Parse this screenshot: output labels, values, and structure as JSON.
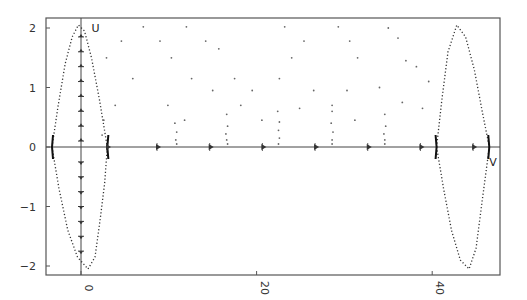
{
  "chart_data": {
    "type": "scatter",
    "title": "",
    "xlabel": "",
    "ylabel": "",
    "xlim": [
      -4,
      47
    ],
    "ylim": [
      -2.2,
      2.2
    ],
    "grid": false,
    "legend": null,
    "x_ticks": [
      {
        "value": 0,
        "label": "0",
        "rotated": true
      },
      {
        "value": 20,
        "label": "20",
        "rotated": true
      },
      {
        "value": 40,
        "label": "40",
        "rotated": true
      }
    ],
    "y_ticks": [
      {
        "value": 2,
        "label": "2"
      },
      {
        "value": 1,
        "label": "1"
      },
      {
        "value": 0,
        "label": "0"
      },
      {
        "value": -1,
        "label": "-1"
      },
      {
        "value": -2,
        "label": "-2"
      }
    ],
    "annotations": [
      {
        "text": "U",
        "x": 1.2,
        "y": 2.0
      },
      {
        "text": "V",
        "x": 46.5,
        "y": -0.25
      }
    ],
    "series": [
      {
        "name": "left-orbit-upper",
        "description": "dotted arc from (-3.3,0) to (3.0,0) peaking at (-0.3,2.05)",
        "points": [
          [
            -3.3,
            0
          ],
          [
            -2.6,
            0.7
          ],
          [
            -1.8,
            1.4
          ],
          [
            -1.0,
            1.85
          ],
          [
            -0.3,
            2.05
          ],
          [
            0.4,
            1.95
          ],
          [
            1.2,
            1.5
          ],
          [
            2.1,
            0.8
          ],
          [
            3.0,
            0
          ]
        ]
      },
      {
        "name": "left-orbit-lower",
        "description": "dotted arc from (-3.3,0) to (3.0,0) with trough at (0.8,-2.05)",
        "points": [
          [
            -3.3,
            0
          ],
          [
            -2.5,
            -0.7
          ],
          [
            -1.5,
            -1.4
          ],
          [
            -0.4,
            -1.85
          ],
          [
            0.8,
            -2.05
          ],
          [
            1.6,
            -1.85
          ],
          [
            2.2,
            -1.2
          ],
          [
            2.7,
            -0.6
          ],
          [
            3.0,
            0
          ]
        ]
      },
      {
        "name": "right-orbit-upper",
        "description": "dotted arc from (40.5,0) to (46.5,0) peaking at (42.8,2.05)",
        "points": [
          [
            40.5,
            0
          ],
          [
            41.1,
            0.8
          ],
          [
            41.8,
            1.6
          ],
          [
            42.8,
            2.05
          ],
          [
            43.8,
            1.85
          ],
          [
            44.8,
            1.3
          ],
          [
            45.7,
            0.6
          ],
          [
            46.5,
            0
          ]
        ]
      },
      {
        "name": "right-orbit-lower",
        "description": "dotted arc from (40.5,0) to (46.5,0) with trough at (44.2,-2.05)",
        "points": [
          [
            40.5,
            0
          ],
          [
            41.3,
            -0.7
          ],
          [
            42.2,
            -1.4
          ],
          [
            43.2,
            -1.9
          ],
          [
            44.2,
            -2.05
          ],
          [
            45.0,
            -1.7
          ],
          [
            45.7,
            -0.9
          ],
          [
            46.5,
            0
          ]
        ]
      },
      {
        "name": "scattered-points",
        "description": "sparse scattered iterates between the two orbits",
        "points": [
          [
            4.6,
            1.78
          ],
          [
            7.1,
            2.02
          ],
          [
            2.9,
            1.5
          ],
          [
            5.9,
            1.15
          ],
          [
            3.9,
            0.7
          ],
          [
            2.6,
            0.45
          ],
          [
            2.4,
            0.2
          ],
          [
            9.0,
            1.78
          ],
          [
            12.0,
            2.02
          ],
          [
            10.3,
            1.5
          ],
          [
            12.6,
            1.15
          ],
          [
            15.0,
            0.95
          ],
          [
            11.8,
            0.45
          ],
          [
            9.9,
            0.7
          ],
          [
            14.2,
            1.78
          ],
          [
            15.7,
            1.65
          ],
          [
            17.5,
            1.15
          ],
          [
            18.2,
            0.7
          ],
          [
            19.5,
            0.95
          ],
          [
            20.6,
            0.45
          ],
          [
            23.2,
            2.02
          ],
          [
            24.0,
            1.5
          ],
          [
            25.4,
            1.78
          ],
          [
            22.6,
            1.15
          ],
          [
            26.5,
            0.95
          ],
          [
            24.9,
            0.65
          ],
          [
            29.3,
            2.02
          ],
          [
            30.6,
            1.78
          ],
          [
            31.5,
            1.5
          ],
          [
            30.3,
            0.95
          ],
          [
            28.6,
            0.7
          ],
          [
            31.2,
            0.45
          ],
          [
            35.0,
            2.0
          ],
          [
            36.1,
            1.83
          ],
          [
            37.0,
            1.45
          ],
          [
            38.2,
            1.35
          ],
          [
            34.0,
            1.0
          ],
          [
            36.6,
            0.75
          ],
          [
            38.9,
            0.65
          ],
          [
            39.6,
            1.1
          ]
        ]
      },
      {
        "name": "cascade-clusters",
        "description": "dot clusters converging to the zero line",
        "points": [
          [
            10.7,
            0.4
          ],
          [
            10.9,
            0.25
          ],
          [
            10.8,
            0.12
          ],
          [
            10.9,
            0.05
          ],
          [
            16.6,
            0.55
          ],
          [
            16.7,
            0.35
          ],
          [
            16.5,
            0.22
          ],
          [
            16.6,
            0.12
          ],
          [
            16.7,
            0.05
          ],
          [
            22.4,
            0.6
          ],
          [
            22.6,
            0.42
          ],
          [
            22.5,
            0.28
          ],
          [
            22.6,
            0.15
          ],
          [
            22.5,
            0.05
          ],
          [
            28.6,
            0.6
          ],
          [
            28.5,
            0.4
          ],
          [
            28.7,
            0.25
          ],
          [
            28.6,
            0.12
          ],
          [
            28.6,
            0.05
          ],
          [
            34.6,
            0.55
          ],
          [
            34.7,
            0.35
          ],
          [
            34.5,
            0.22
          ],
          [
            34.6,
            0.12
          ],
          [
            34.6,
            0.05
          ]
        ]
      },
      {
        "name": "zero-line-arrows",
        "description": "flow arrows along y=0 pointing right",
        "points": [
          [
            3.3,
            0
          ],
          [
            9.0,
            0
          ],
          [
            15.0,
            0
          ],
          [
            21.0,
            0
          ],
          [
            27.0,
            0
          ],
          [
            33.0,
            0
          ],
          [
            39.0,
            0
          ],
          [
            45.0,
            0
          ]
        ]
      },
      {
        "name": "x0-vertical-arrows",
        "description": "tick/arrow marks along x=0 line",
        "points": [
          [
            0,
            1.85
          ],
          [
            0,
            1.6
          ],
          [
            0,
            1.35
          ],
          [
            0,
            1.1
          ],
          [
            0,
            0.85
          ],
          [
            0,
            0.6
          ],
          [
            0,
            0.35
          ],
          [
            0,
            0.1
          ],
          [
            0,
            -0.25
          ],
          [
            0,
            -0.5
          ],
          [
            0,
            -0.75
          ],
          [
            0,
            -1.0
          ],
          [
            0,
            -1.25
          ],
          [
            0,
            -1.5
          ],
          [
            0,
            -1.75
          ]
        ]
      }
    ]
  }
}
